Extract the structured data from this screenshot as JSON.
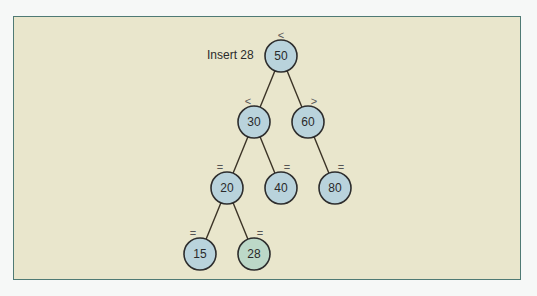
{
  "caption": "Insert 28",
  "colors": {
    "background": "#f6f8f7",
    "panel": "#e9e6cc",
    "panel_border": "#4f7a74",
    "node_fill": "#b9d3dc",
    "new_node_fill": "#bcd8c8",
    "node_stroke": "#2d2d2d",
    "edge": "#3b3326"
  },
  "tree": {
    "nodes": [
      {
        "id": "n50",
        "value": "50",
        "x": 281,
        "y": 56,
        "op": "<",
        "op_x": 281,
        "op_y": 35,
        "new": false
      },
      {
        "id": "n30",
        "value": "30",
        "x": 254,
        "y": 122,
        "op": "<",
        "op_x": 248,
        "op_y": 101,
        "new": false
      },
      {
        "id": "n60",
        "value": "60",
        "x": 308,
        "y": 122,
        "op": ">",
        "op_x": 314,
        "op_y": 101,
        "new": false
      },
      {
        "id": "n20",
        "value": "20",
        "x": 227,
        "y": 188,
        "op": "=",
        "op_x": 220,
        "op_y": 167,
        "new": false
      },
      {
        "id": "n40",
        "value": "40",
        "x": 281,
        "y": 188,
        "op": "=",
        "op_x": 287,
        "op_y": 167,
        "new": false
      },
      {
        "id": "n80",
        "value": "80",
        "x": 335,
        "y": 188,
        "op": "=",
        "op_x": 341,
        "op_y": 167,
        "new": false
      },
      {
        "id": "n15",
        "value": "15",
        "x": 200,
        "y": 254,
        "op": "=",
        "op_x": 193,
        "op_y": 233,
        "new": false
      },
      {
        "id": "n28",
        "value": "28",
        "x": 254,
        "y": 254,
        "op": "=",
        "op_x": 260,
        "op_y": 233,
        "new": true
      }
    ],
    "edges": [
      [
        "n50",
        "n30"
      ],
      [
        "n50",
        "n60"
      ],
      [
        "n30",
        "n20"
      ],
      [
        "n30",
        "n40"
      ],
      [
        "n60",
        "n80"
      ],
      [
        "n20",
        "n15"
      ],
      [
        "n20",
        "n28"
      ]
    ]
  }
}
